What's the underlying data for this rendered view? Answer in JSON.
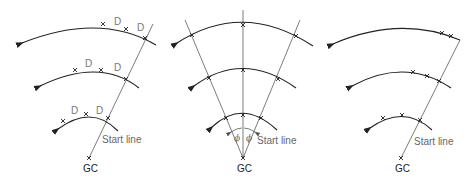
{
  "panels": [
    {
      "id": "left",
      "center_label": "GC",
      "start_line_label": "Start line",
      "spacing_labels": [
        "D",
        "D",
        "D",
        "D",
        "D",
        "D"
      ],
      "arcs": 3
    },
    {
      "id": "middle",
      "center_label": "GC",
      "start_line_label": "Start line",
      "angle_labels": [
        "ϕ",
        "ϕ"
      ],
      "arcs": 3
    },
    {
      "id": "right",
      "center_label": "GC",
      "start_line_label": "Start line",
      "arcs": 3
    }
  ]
}
